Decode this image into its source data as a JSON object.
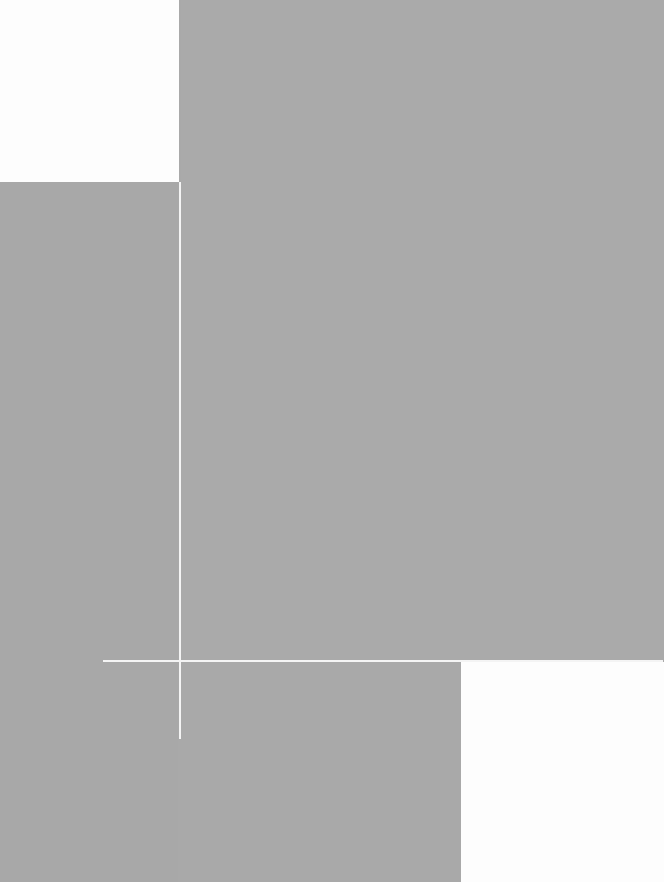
{
  "image": {
    "description": "Abstract geometric composition of gray planes with white rectangles and thin white lines",
    "colors": {
      "gray": "#a9a9a9",
      "white": "#fdfdfd",
      "line": "#f4f4f4"
    },
    "shapes": [
      {
        "name": "white-rect-top-left",
        "x": 0,
        "y": 0,
        "w": 179,
        "h": 182
      },
      {
        "name": "white-rect-bottom-right",
        "x": 461,
        "y": 661,
        "w": 203,
        "h": 221
      },
      {
        "name": "vertical-line",
        "x": 179,
        "y": 182,
        "w": 2,
        "h": 557
      },
      {
        "name": "horizontal-line",
        "x": 103,
        "y": 660,
        "w": 560,
        "h": 2
      }
    ]
  }
}
